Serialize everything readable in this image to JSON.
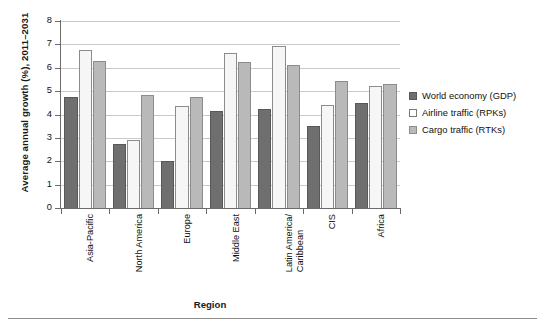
{
  "chart_data": {
    "type": "bar",
    "title": "",
    "xlabel": "Region",
    "ylabel": "Average annual growth (%), 2011–2031",
    "categories": [
      "Asia-Pacific",
      "North America",
      "Europe",
      "Middle East",
      "Latin America/Caribbean",
      "CIS",
      "Africa"
    ],
    "category_lines": [
      [
        "Asia-Pacific"
      ],
      [
        "North America"
      ],
      [
        "Europe"
      ],
      [
        "Middle East"
      ],
      [
        "Latin America/",
        "Caribbean"
      ],
      [
        "CIS"
      ],
      [
        "Africa"
      ]
    ],
    "series": [
      {
        "name": "World economy (GDP)",
        "color": "#6f6f6f",
        "values": [
          4.75,
          2.75,
          2.0,
          4.15,
          4.25,
          3.5,
          4.5
        ]
      },
      {
        "name": "Airline traffic (RPKs)",
        "color": "#f6f6f6",
        "values": [
          6.75,
          2.9,
          4.35,
          6.65,
          6.95,
          4.4,
          5.2
        ]
      },
      {
        "name": "Cargo traffic (RTKs)",
        "color": "#b9b9b9",
        "values": [
          6.3,
          4.85,
          4.75,
          6.25,
          6.1,
          5.45,
          5.3
        ]
      }
    ],
    "ylim": [
      0,
      8
    ],
    "yticks": [
      0,
      1,
      2,
      3,
      4,
      5,
      6,
      7,
      8
    ],
    "ytick_labels": [
      "0",
      "1",
      "2",
      "3",
      "4",
      "5",
      "6",
      "7",
      "8"
    ],
    "grid": true,
    "legend_position": "right"
  }
}
